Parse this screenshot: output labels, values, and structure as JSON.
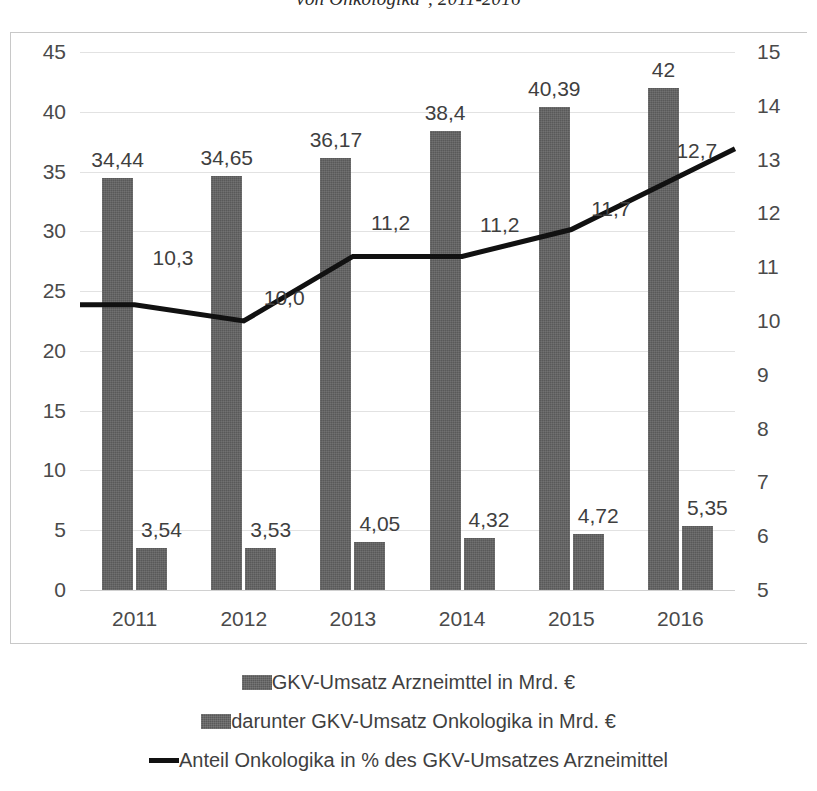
{
  "chart_data": {
    "type": "bar",
    "title": "von Onkologika\", 2011-2016",
    "xlabel": "",
    "ylabel": "",
    "categories": [
      "2011",
      "2012",
      "2013",
      "2014",
      "2015",
      "2016"
    ],
    "series": [
      {
        "name": "GKV-Umsatz Arzneimttel in Mrd. €",
        "type": "bar",
        "axis": "left",
        "values": [
          34.44,
          34.65,
          36.17,
          38.4,
          40.39,
          42
        ],
        "labels": [
          "34,44",
          "34,65",
          "36,17",
          "38,4",
          "40,39",
          "42"
        ],
        "color": "#595959"
      },
      {
        "name": "darunter GKV-Umsatz Onkologika in Mrd. €",
        "type": "bar",
        "axis": "left",
        "values": [
          3.54,
          3.53,
          4.05,
          4.32,
          4.72,
          5.35
        ],
        "labels": [
          "3,54",
          "3,53",
          "4,05",
          "4,32",
          "4,72",
          "5,35"
        ],
        "color": "#595959"
      },
      {
        "name": "Anteil Onkologika in % des GKV-Umsatzes Arzneimittel",
        "type": "line",
        "axis": "right",
        "values": [
          10.3,
          10.0,
          11.2,
          11.2,
          11.7,
          12.7
        ],
        "labels": [
          "10,3",
          "10,0",
          "11,2",
          "11,2",
          "11,7",
          "12,7"
        ],
        "color": "#111111"
      }
    ],
    "left_axis": {
      "min": 0,
      "max": 45,
      "step": 5,
      "ticks": [
        "0",
        "5",
        "10",
        "15",
        "20",
        "25",
        "30",
        "35",
        "40",
        "45"
      ]
    },
    "right_axis": {
      "min": 5,
      "max": 15,
      "step": 1,
      "ticks": [
        "5",
        "6",
        "7",
        "8",
        "9",
        "10",
        "11",
        "12",
        "13",
        "14",
        "15"
      ]
    },
    "grid": true,
    "legend_position": "bottom"
  },
  "legend": {
    "items": [
      {
        "marker": "swatch",
        "label": "GKV-Umsatz Arzneimttel in Mrd. €"
      },
      {
        "marker": "swatch",
        "label": "darunter GKV-Umsatz Onkologika in Mrd. €"
      },
      {
        "marker": "line",
        "label": "Anteil Onkologika in % des GKV-Umsatzes Arzneimittel"
      }
    ]
  },
  "colors": {
    "bar": "#595959",
    "line": "#111111",
    "grid": "#e2e2e2",
    "text": "#3f3f3f",
    "frame": "#c8c8c8",
    "background": "#ffffff"
  }
}
